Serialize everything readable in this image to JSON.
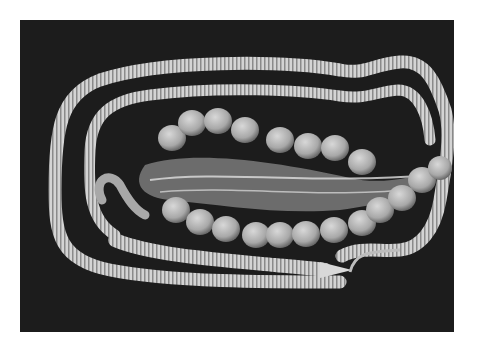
{
  "image": {
    "subject": "dissected snake with chain of eggs on dark background",
    "alt": "Photograph of a dissected snake laid in a loop with two rows of eggs along its body",
    "egg_count_visible": 26,
    "colors": {
      "background": "#1c1c1c",
      "body": "#cfcfcf",
      "egg": "#b5b5b5",
      "page": "#ffffff"
    }
  }
}
